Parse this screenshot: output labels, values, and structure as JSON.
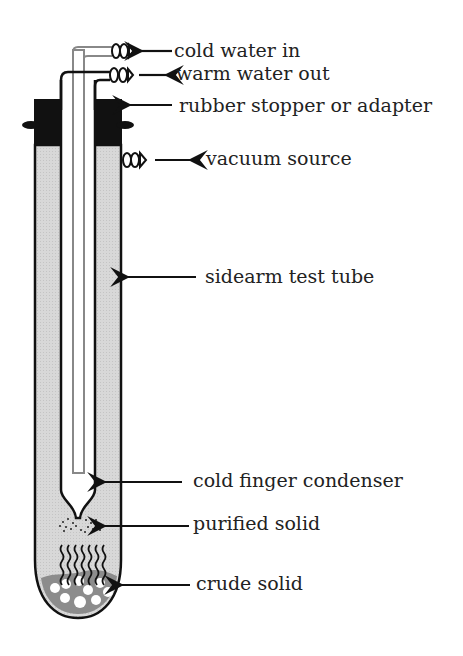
{
  "figure": {
    "labels": {
      "cold_water_in": "cold water in",
      "warm_water_out": "warm water out",
      "stopper": "rubber stopper or adapter",
      "vacuum": "vacuum source",
      "test_tube": "sidearm test tube",
      "condenser": "cold finger condenser",
      "purified": "purified solid",
      "crude": "crude solid"
    },
    "colors": {
      "stroke": "#111111",
      "tube_fill": "#d6d6d6",
      "stopper_fill": "#111111",
      "crude_fill": "#8a8a8a",
      "inner_tube": "#888888"
    }
  }
}
